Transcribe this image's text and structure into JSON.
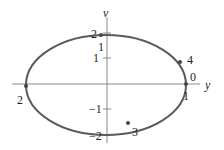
{
  "diagram": {
    "type": "phase-plane-orbit",
    "axes": {
      "horizontal_label": "y",
      "vertical_label": "v",
      "vertical_ticks": [
        "2",
        "1",
        "-1",
        "-2"
      ]
    },
    "curve": {
      "shape": "ellipse",
      "color": "#555555"
    },
    "points": [
      {
        "id": "p0",
        "labels": [
          "0",
          "1"
        ],
        "description": "rightmost point on y-axis"
      },
      {
        "id": "p4",
        "labels": [
          "4"
        ],
        "description": "upper right of ellipse"
      },
      {
        "id": "p2_top",
        "labels": [
          "2"
        ],
        "description": "top of ellipse near v-axis"
      },
      {
        "id": "p2_left",
        "labels": [
          "2"
        ],
        "description": "leftmost point on y-axis"
      },
      {
        "id": "p3",
        "labels": [
          "3"
        ],
        "description": "lower part of ellipse"
      }
    ],
    "tick_labels": {
      "top_near_axis": "1"
    },
    "colors": {
      "axis": "#777777",
      "curve": "#555555",
      "text": "#222222"
    }
  }
}
